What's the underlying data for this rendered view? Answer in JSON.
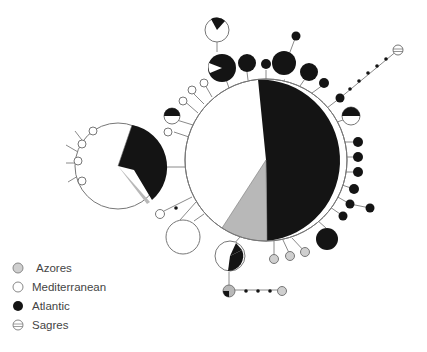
{
  "colors": {
    "azores": "#b8b8b8",
    "mediterranean": "#ffffff",
    "atlantic": "#141414",
    "sagres": "#ffffff",
    "edge": "#8a8a8a"
  },
  "legend": {
    "items": [
      {
        "label": "Azores",
        "key": "azores"
      },
      {
        "label": "Mediterranean",
        "key": "mediterranean"
      },
      {
        "label": "Atlantic",
        "key": "atlantic"
      },
      {
        "label": "Sagres",
        "key": "sagres"
      }
    ]
  },
  "network": {
    "main_haplotype": {
      "cx": 266,
      "cy": 160,
      "r": 81,
      "proportions": {
        "atlantic": 0.5,
        "azores": 0.07,
        "mediterranean": 0.43
      }
    },
    "secondary_haplotype": {
      "cx": 118,
      "cy": 166,
      "r": 43,
      "proportions": {
        "atlantic": 0.4,
        "azores": 0.02,
        "mediterranean": 0.58
      }
    }
  }
}
